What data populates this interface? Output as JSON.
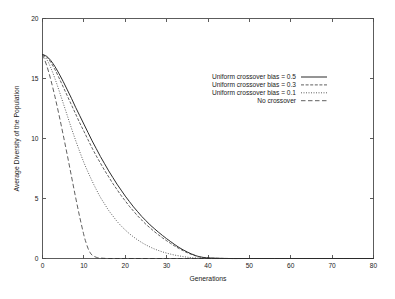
{
  "chart_data": {
    "type": "line",
    "title": "",
    "xlabel": "Generations",
    "ylabel": "Average Diversity of the Population",
    "xlim": [
      0,
      80
    ],
    "ylim": [
      0,
      20
    ],
    "xticks": [
      0,
      10,
      20,
      30,
      40,
      50,
      60,
      70,
      80
    ],
    "yticks": [
      0,
      5,
      10,
      15,
      20
    ],
    "xtick_labels": [
      "0",
      "10",
      "20",
      "30",
      "40",
      "50",
      "60",
      "70",
      "80"
    ],
    "ytick_labels": [
      "0",
      "5",
      "10",
      "15",
      "20"
    ],
    "grid": false,
    "legend_position": "upper-center-right",
    "series": [
      {
        "name": "Uniform crossover bias = 0.5",
        "style": "solid",
        "color": "#2b2b2b",
        "x": [
          0,
          1,
          2,
          3,
          4,
          5,
          6,
          7,
          8,
          9,
          10,
          11,
          12,
          13,
          14,
          15,
          16,
          17,
          18,
          19,
          20,
          21,
          22,
          23,
          24,
          25,
          26,
          27,
          28,
          29,
          30,
          31,
          32,
          33,
          34,
          35,
          36,
          37,
          38,
          40,
          45,
          50,
          60,
          70,
          80
        ],
        "y": [
          17.0,
          16.85,
          16.5,
          16.0,
          15.4,
          14.75,
          14.05,
          13.35,
          12.6,
          11.9,
          11.2,
          10.5,
          9.8,
          9.15,
          8.5,
          7.9,
          7.3,
          6.75,
          6.2,
          5.7,
          5.2,
          4.75,
          4.3,
          3.9,
          3.5,
          3.15,
          2.8,
          2.5,
          2.2,
          1.92,
          1.65,
          1.4,
          1.15,
          0.92,
          0.72,
          0.54,
          0.38,
          0.25,
          0.15,
          0.05,
          0.0,
          0.0,
          0.0,
          0.0,
          0.0
        ]
      },
      {
        "name": "Uniform crossover bias = 0.3",
        "style": "dashed",
        "color": "#2b2b2b",
        "x": [
          0,
          1,
          2,
          3,
          4,
          5,
          6,
          7,
          8,
          9,
          10,
          11,
          12,
          13,
          14,
          15,
          16,
          17,
          18,
          19,
          20,
          21,
          22,
          23,
          24,
          25,
          26,
          27,
          28,
          29,
          30,
          31,
          32,
          33,
          34,
          35,
          36,
          37,
          38,
          40,
          45,
          50,
          60,
          70,
          80
        ],
        "y": [
          17.0,
          16.8,
          16.35,
          15.75,
          15.05,
          14.3,
          13.55,
          12.8,
          12.05,
          11.3,
          10.6,
          9.9,
          9.2,
          8.55,
          7.95,
          7.35,
          6.8,
          6.25,
          5.75,
          5.25,
          4.8,
          4.35,
          3.95,
          3.55,
          3.2,
          2.85,
          2.55,
          2.25,
          1.98,
          1.72,
          1.48,
          1.25,
          1.03,
          0.83,
          0.65,
          0.48,
          0.34,
          0.22,
          0.13,
          0.04,
          0.0,
          0.0,
          0.0,
          0.0,
          0.0
        ]
      },
      {
        "name": "Uniform crossover bias = 0.1",
        "style": "dotted",
        "color": "#4a4a4a",
        "x": [
          0,
          1,
          2,
          3,
          4,
          5,
          6,
          7,
          8,
          9,
          10,
          11,
          12,
          13,
          14,
          15,
          16,
          17,
          18,
          19,
          20,
          21,
          22,
          23,
          24,
          25,
          26,
          27,
          28,
          29,
          30,
          31,
          32,
          33,
          34,
          35,
          36,
          38,
          40,
          45,
          50,
          60,
          70,
          80
        ],
        "y": [
          17.0,
          16.6,
          15.9,
          15.0,
          14.0,
          12.95,
          11.9,
          10.85,
          9.85,
          8.9,
          8.0,
          7.2,
          6.45,
          5.75,
          5.1,
          4.55,
          4.0,
          3.55,
          3.1,
          2.72,
          2.38,
          2.07,
          1.8,
          1.55,
          1.33,
          1.13,
          0.96,
          0.8,
          0.67,
          0.55,
          0.45,
          0.36,
          0.28,
          0.22,
          0.16,
          0.11,
          0.07,
          0.03,
          0.0,
          0.0,
          0.0,
          0.0,
          0.0,
          0.0
        ]
      },
      {
        "name": "No crossover",
        "style": "longdash",
        "color": "#6a6a6a",
        "x": [
          0,
          1,
          2,
          3,
          4,
          5,
          6,
          7,
          8,
          9,
          10,
          10.5,
          11,
          11.5,
          12,
          13,
          14,
          16,
          20,
          30,
          40,
          60,
          80
        ],
        "y": [
          17.0,
          16.1,
          14.9,
          13.5,
          11.95,
          10.3,
          8.6,
          6.85,
          5.1,
          3.45,
          1.95,
          1.35,
          0.85,
          0.5,
          0.28,
          0.1,
          0.04,
          0.0,
          0.0,
          0.0,
          0.0,
          0.0,
          0.0
        ]
      }
    ]
  },
  "legend": {
    "entries": [
      {
        "label": "Uniform crossover bias = 0.5"
      },
      {
        "label": "Uniform crossover bias = 0.3"
      },
      {
        "label": "Uniform crossover bias = 0.1"
      },
      {
        "label": "No crossover"
      }
    ]
  }
}
